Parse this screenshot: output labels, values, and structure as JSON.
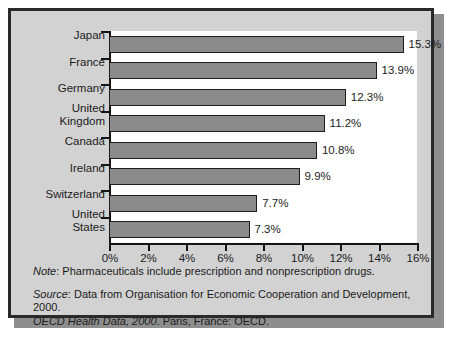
{
  "chart_data": {
    "type": "bar",
    "orientation": "horizontal",
    "title": "",
    "xlabel": "",
    "ylabel": "",
    "xlim": [
      0,
      16
    ],
    "xticks": [
      "0%",
      "2%",
      "4%",
      "6%",
      "8%",
      "10%",
      "12%",
      "14%",
      "16%"
    ],
    "xtick_values": [
      0,
      2,
      4,
      6,
      8,
      10,
      12,
      14,
      16
    ],
    "grid": false,
    "legend": "none",
    "categories": [
      "Japan",
      "France",
      "Germany",
      "United\nKingdom",
      "Canada",
      "Ireland",
      "Switzerland",
      "United\nStates"
    ],
    "values": [
      15.3,
      13.9,
      12.3,
      11.2,
      10.8,
      9.9,
      7.7,
      7.3
    ],
    "data_labels": [
      "15.3%",
      "13.9%",
      "12.3%",
      "11.2%",
      "10.8%",
      "9.9%",
      "7.7%",
      "7.3%"
    ]
  },
  "notes": {
    "note_label": "Note",
    "note_text": ": Pharmaceuticals include prescription and nonprescription drugs.",
    "source_label": "Source",
    "source_text": ": Data from Organisation for Economic Cooperation and Development, 2000.",
    "source_italic_cont": "OECD Health Data, 2000",
    "source_text_cont": ". Paris, France: OECD."
  },
  "colors": {
    "bar_fill": "#8b8b8b",
    "bar_stroke": "#1d1d1d",
    "panel_bg": "#d2d2d2",
    "plot_bg": "#ffffff",
    "frame": "#2a2a2a",
    "text": "#1b1b1b"
  }
}
